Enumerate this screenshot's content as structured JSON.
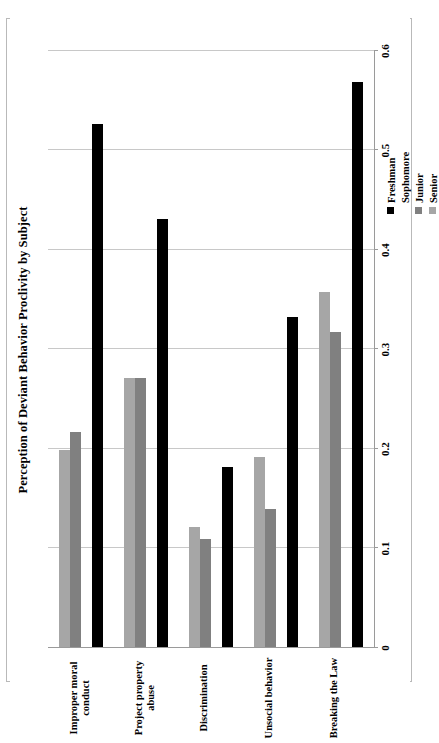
{
  "chart_data": {
    "type": "bar",
    "orientation": "horizontal",
    "title": "Perception of Deviant Behavior Proclivity by Subject",
    "xlabel": "",
    "ylabel": "",
    "xlim": [
      0,
      0.6
    ],
    "grid": true,
    "legend_position": "top-right",
    "tick_labels": [
      "0",
      "0.1",
      "0.2",
      "0.3",
      "0.4",
      "0.5",
      "0.6"
    ],
    "tick_values": [
      0,
      0.1,
      0.2,
      0.3,
      0.4,
      0.5,
      0.6
    ],
    "categories": [
      "Breaking the Law",
      "Unsocial behavior",
      "Discrimination",
      "Project property\nabuse",
      "Improper moral\nconduct"
    ],
    "series": [
      {
        "name": "Freshman",
        "color": "#000000",
        "values": [
          0.568,
          0.332,
          0.181,
          0.43,
          0.526
        ]
      },
      {
        "name": "Sophomore",
        "color": "#ffffff",
        "values": [
          0.0,
          0.0,
          0.0,
          0.0,
          0.0
        ]
      },
      {
        "name": "Junior",
        "color": "#808080",
        "values": [
          0.317,
          0.139,
          0.109,
          0.27,
          0.216
        ]
      },
      {
        "name": "Senior",
        "color": "#a6a6a6",
        "values": [
          0.357,
          0.191,
          0.121,
          0.27,
          0.198
        ]
      }
    ]
  },
  "legend": {
    "items": [
      {
        "label": "Freshman"
      },
      {
        "label": "Sophomore"
      },
      {
        "label": "Junior"
      },
      {
        "label": "Senior"
      }
    ]
  }
}
